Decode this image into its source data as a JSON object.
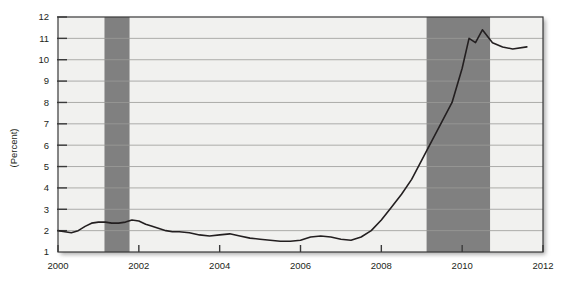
{
  "chart_data": {
    "type": "line",
    "title": "",
    "subtitle": "",
    "xlabel": "",
    "ylabel": "(Percent)",
    "xlim": [
      2000.0,
      2012.0
    ],
    "ylim": [
      1,
      12
    ],
    "grid": true,
    "legend_position": "none",
    "xticks": [
      2000,
      2002,
      2004,
      2006,
      2008,
      2010,
      2012
    ],
    "xtick_labels": [
      "2000",
      "2002",
      "2004",
      "2006",
      "2008",
      "2010",
      "2012"
    ],
    "yticks": [
      1,
      2,
      3,
      4,
      5,
      6,
      7,
      8,
      9,
      10,
      11,
      12
    ],
    "ytick_labels": [
      "1",
      "2",
      "3",
      "4",
      "5",
      "6",
      "7",
      "8",
      "9",
      "10",
      "11",
      "12"
    ],
    "line_color": "#231f20",
    "plot_bg_color": "#f1f1ef",
    "gridline_color": "#9a9a98",
    "shaded_band_color": "#808080",
    "shaded_bands": [
      {
        "label": "recession-2001",
        "start": 2001.15,
        "end": 2001.77
      },
      {
        "label": "recession-2008",
        "start": 2009.12,
        "end": 2010.69
      }
    ],
    "series": [
      {
        "name": "Unemployment rate",
        "x": [
          2000.0,
          2000.17,
          2000.33,
          2000.5,
          2000.67,
          2000.83,
          2001.0,
          2001.17,
          2001.33,
          2001.5,
          2001.67,
          2001.83,
          2002.0,
          2002.17,
          2002.33,
          2002.5,
          2002.67,
          2002.83,
          2003.0,
          2003.25,
          2003.5,
          2003.75,
          2004.0,
          2004.25,
          2004.5,
          2004.75,
          2005.0,
          2005.25,
          2005.5,
          2005.75,
          2006.0,
          2006.25,
          2006.5,
          2006.75,
          2007.0,
          2007.25,
          2007.5,
          2007.75,
          2008.0,
          2008.25,
          2008.5,
          2008.75,
          2009.0,
          2009.25,
          2009.5,
          2009.75,
          2010.0,
          2010.17,
          2010.33,
          2010.5,
          2010.75,
          2011.0,
          2011.25,
          2011.6
        ],
        "y": [
          2.0,
          1.95,
          1.9,
          2.0,
          2.2,
          2.35,
          2.4,
          2.4,
          2.35,
          2.35,
          2.4,
          2.5,
          2.45,
          2.3,
          2.2,
          2.1,
          2.0,
          1.95,
          1.95,
          1.9,
          1.8,
          1.75,
          1.8,
          1.85,
          1.75,
          1.65,
          1.6,
          1.55,
          1.5,
          1.5,
          1.55,
          1.7,
          1.75,
          1.7,
          1.6,
          1.55,
          1.7,
          2.0,
          2.5,
          3.1,
          3.7,
          4.4,
          5.3,
          6.2,
          7.1,
          8.0,
          9.6,
          11.0,
          10.8,
          11.4,
          10.8,
          10.6,
          10.5,
          10.6
        ]
      }
    ]
  }
}
